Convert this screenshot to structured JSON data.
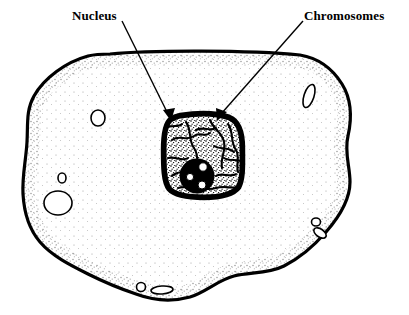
{
  "figure": {
    "background_color": "#ffffff",
    "ink_color": "#000000",
    "width": 409,
    "height": 315
  },
  "labels": [
    {
      "id": "nucleus",
      "text": "Nucleus",
      "x": 72,
      "y": 8,
      "leader_from_x": 122,
      "leader_from_y": 21,
      "leader_to_x": 171,
      "leader_to_y": 119
    },
    {
      "id": "chromosomes",
      "text": "Chromosomes",
      "x": 304,
      "y": 8,
      "leader_from_x": 303,
      "leader_from_y": 21,
      "leader_to_x": 219,
      "leader_to_y": 119
    }
  ],
  "structures": {
    "cell_membrane": {
      "name": "cell membrane",
      "style": "irregular amoeboid outline with stippled inner border"
    },
    "cytoplasm": {
      "name": "cytoplasm",
      "style": "white with sparse stipple dots"
    },
    "nucleus": {
      "name": "nucleus",
      "shape": "rounded square",
      "center_x": 203,
      "center_y": 156,
      "width": 80,
      "height": 85,
      "border": "thick dark stippled envelope"
    },
    "nucleolus": {
      "name": "nucleolus",
      "center_x": 197,
      "center_y": 176,
      "radius": 17,
      "vacuole_count": 3
    },
    "chromatin": {
      "name": "chromosome threads",
      "style": "dark branching squiggles across nuclear interior",
      "thread_count": 12
    },
    "vacuoles": [
      {
        "id": "v1",
        "cx": 98,
        "cy": 118,
        "rx": 7,
        "ry": 8
      },
      {
        "id": "v2",
        "cx": 62,
        "cy": 178,
        "rx": 4,
        "ry": 5
      },
      {
        "id": "v3",
        "cx": 58,
        "cy": 203,
        "rx": 14,
        "ry": 12
      },
      {
        "id": "v4",
        "cx": 309,
        "cy": 96,
        "rx": 5,
        "ry": 12
      },
      {
        "id": "v5",
        "cx": 316,
        "cy": 222,
        "rx": 4,
        "ry": 4
      },
      {
        "id": "v6",
        "cx": 320,
        "cy": 232,
        "rx": 6,
        "ry": 4
      },
      {
        "id": "v7",
        "cx": 141,
        "cy": 287,
        "rx": 4,
        "ry": 4
      },
      {
        "id": "v8",
        "cx": 161,
        "cy": 290,
        "rx": 10,
        "ry": 4
      }
    ]
  }
}
